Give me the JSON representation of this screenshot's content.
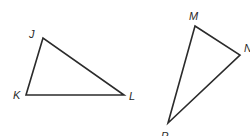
{
  "diagram": {
    "stroke_color": "#2b2b2b",
    "triangles": [
      {
        "name": "JKL",
        "vertices": [
          {
            "label": "J",
            "x": 43,
            "y": 38,
            "lx": 29,
            "ly": 38
          },
          {
            "label": "K",
            "x": 26,
            "y": 95,
            "lx": 13,
            "ly": 99
          },
          {
            "label": "L",
            "x": 124,
            "y": 95,
            "lx": 129,
            "ly": 100
          }
        ]
      },
      {
        "name": "MNP",
        "vertices": [
          {
            "label": "M",
            "x": 195,
            "y": 26,
            "lx": 189,
            "ly": 20
          },
          {
            "label": "N",
            "x": 240,
            "y": 55,
            "lx": 244,
            "ly": 52
          },
          {
            "label": "P",
            "x": 168,
            "y": 123,
            "lx": 161,
            "ly": 140
          }
        ]
      }
    ]
  }
}
